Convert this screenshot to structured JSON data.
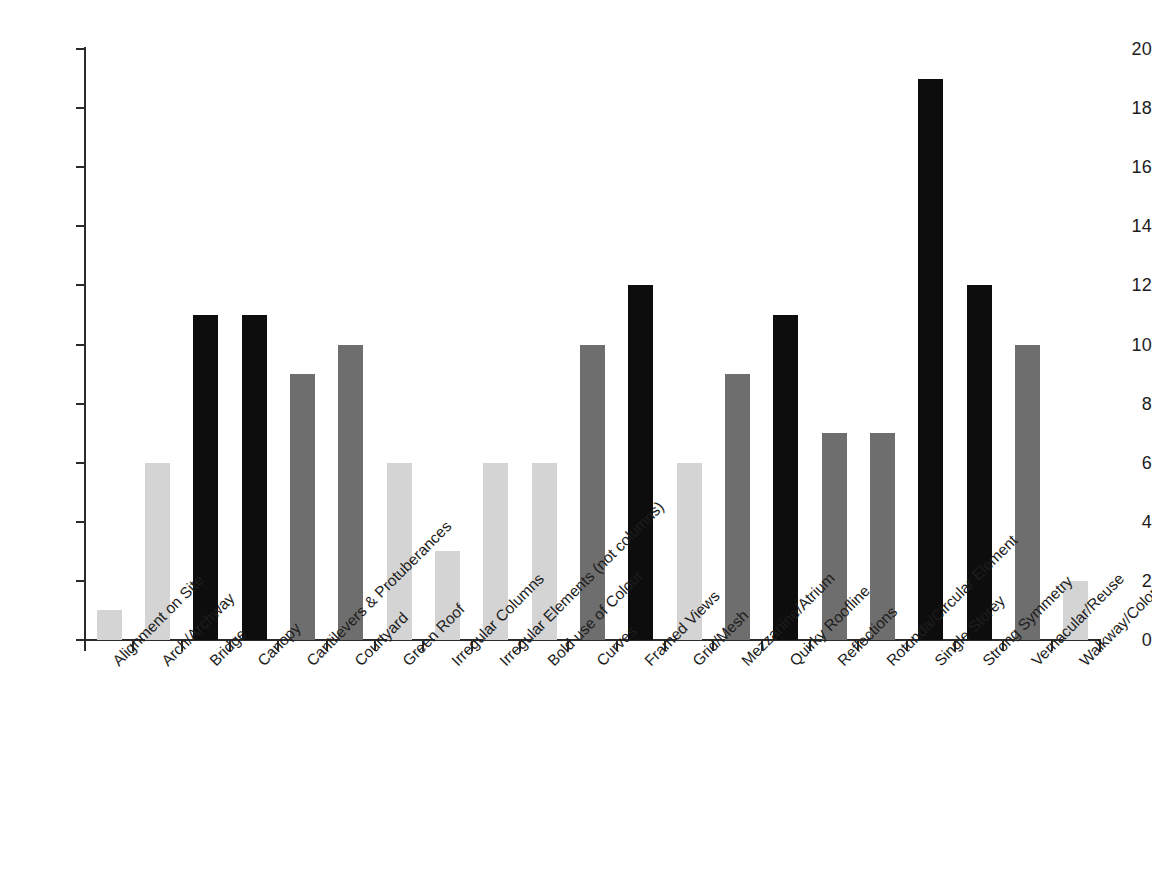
{
  "chart_data": {
    "type": "bar",
    "title": "",
    "subtitle": "",
    "xlabel": "",
    "ylabel": "",
    "ylim": [
      0,
      20
    ],
    "y_ticks": [
      0,
      2,
      4,
      6,
      8,
      10,
      12,
      14,
      16,
      18,
      20
    ],
    "grid": false,
    "legend": "none",
    "categories": [
      "Alignment on Site",
      "Arch/Archway",
      "Bridge",
      "Canopy",
      "Cantilevers & Protuberances",
      "Courtyard",
      "Green Roof",
      "Irregular Columns",
      "Irregular Elements (not columns)",
      "Bold use of Colour",
      "Curves",
      "Framed Views",
      "Grid/Mesh",
      "Mezzanine/Atrium",
      "Quirky Roofline",
      "Reflections",
      "Rotunda/Circular Element",
      "Single Storey",
      "Strong Symmetry",
      "Vernacular/Reuse",
      "Walkway/Colonnade/Portico"
    ],
    "values": [
      1,
      6,
      11,
      11,
      9,
      10,
      6,
      3,
      6,
      6,
      10,
      12,
      6,
      9,
      11,
      7,
      7,
      19,
      12,
      10,
      2
    ],
    "bar_shades": [
      "light",
      "light",
      "dark",
      "dark",
      "medium",
      "medium",
      "light",
      "light",
      "light",
      "light",
      "medium",
      "dark",
      "light",
      "medium",
      "dark",
      "medium",
      "medium",
      "dark",
      "dark",
      "medium",
      "light"
    ]
  },
  "colors": {
    "light": "#d4d4d4",
    "medium": "#6e6e6e",
    "dark": "#0d0d0d",
    "axis": "#2b2b2b",
    "text": "#1d1d1d",
    "background": "#ffffff"
  }
}
